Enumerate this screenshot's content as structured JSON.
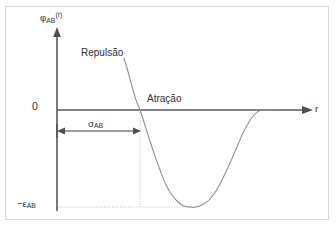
{
  "figure": {
    "title": ""
  },
  "axes": {
    "y_label_symbol": "φ",
    "y_label_subscript": "AB",
    "y_label_superscript": "(r)",
    "x_label": "r",
    "zero_tick": "0",
    "epsilon_tick_symbol": "−ε",
    "epsilon_tick_subscript": "AB"
  },
  "annotations": {
    "repulsion": "Repulsão",
    "attraction": "Atração",
    "sigma_symbol": "σ",
    "sigma_subscript": "AB"
  },
  "colors": {
    "frame_border": "#d8d8d8",
    "axis": "#58595b",
    "curve": "#8b8c8e",
    "guide": "#b9babc",
    "sigma_arrow": "#3f4042",
    "text": "#2f3031",
    "background": "#ffffff"
  },
  "chart_data": {
    "type": "line",
    "title": "",
    "xlabel": "r",
    "ylabel": "φAB(r)",
    "grid": false,
    "legend": null,
    "axis_origin_px": {
      "x": 57,
      "y": 110
    },
    "x_axis_end_px": 312,
    "y_axis_top_px": 30,
    "markers": {
      "sigma_AB": {
        "label": "σAB",
        "value_px_x": 140,
        "meaning": "separation where potential crosses zero"
      },
      "epsilon_AB": {
        "label": "−εAB",
        "value_px_y": 207,
        "meaning": "depth of the potential well (minimum)"
      },
      "minimum_px": {
        "x": 190,
        "y": 207
      }
    },
    "series": [
      {
        "name": "φAB(r)",
        "points_px": [
          [
            124,
            58
          ],
          [
            127,
            68
          ],
          [
            130,
            79
          ],
          [
            133,
            90
          ],
          [
            136,
            100
          ],
          [
            140,
            110
          ],
          [
            144,
            122
          ],
          [
            149,
            138
          ],
          [
            154,
            153
          ],
          [
            160,
            170
          ],
          [
            166,
            185
          ],
          [
            172,
            195
          ],
          [
            178,
            202
          ],
          [
            184,
            206
          ],
          [
            190,
            207
          ],
          [
            196,
            207
          ],
          [
            202,
            205
          ],
          [
            209,
            200
          ],
          [
            216,
            191
          ],
          [
            223,
            178
          ],
          [
            230,
            163
          ],
          [
            237,
            147
          ],
          [
            243,
            133
          ],
          [
            249,
            122
          ],
          [
            254,
            115
          ],
          [
            259,
            111
          ],
          [
            264,
            110
          ],
          [
            270,
            110
          ],
          [
            278,
            110
          ]
        ]
      }
    ],
    "regions": [
      {
        "label": "Repulsão",
        "description": "steep rising branch at small r"
      },
      {
        "label": "Atração",
        "description": "attractive well approaching zero at large r"
      }
    ]
  }
}
